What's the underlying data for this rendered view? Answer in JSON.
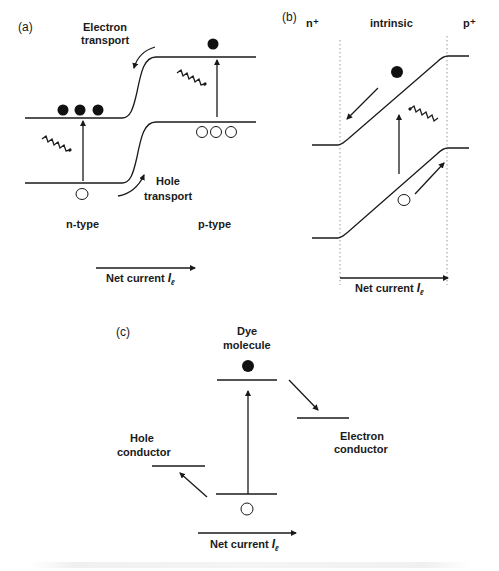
{
  "panels": {
    "a": {
      "label": "(a)",
      "electron_transport": [
        "Electron",
        "transport"
      ],
      "hole_transport": [
        "Hole",
        "transport"
      ],
      "left_region": "n-type",
      "right_region": "p-type",
      "current": {
        "text": "Net current ",
        "symbol": "I",
        "subscript": "ℓ"
      }
    },
    "b": {
      "label": "(b)",
      "left_region": "n⁺",
      "middle_region": "intrinsic",
      "right_region": "p⁺",
      "current": {
        "text": "Net current ",
        "symbol": "I",
        "subscript": "ℓ"
      }
    },
    "c": {
      "label": "(c)",
      "dye": [
        "Dye",
        "molecule"
      ],
      "hole_conductor": [
        "Hole",
        "conductor"
      ],
      "electron_conductor": [
        "Electron",
        "conductor"
      ],
      "current": {
        "text": "Net current ",
        "symbol": "I",
        "subscript": "ℓ"
      }
    }
  },
  "colors": {
    "ink": "#1a1a1a",
    "background": "#ffffff",
    "guide": "#999999"
  }
}
